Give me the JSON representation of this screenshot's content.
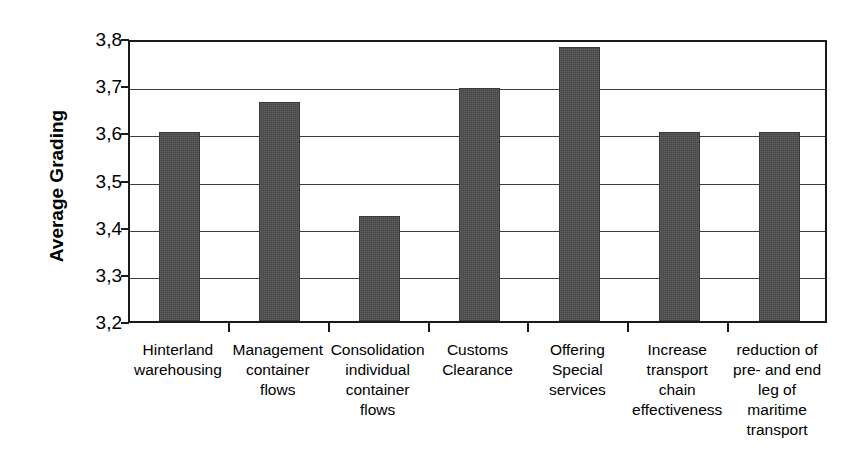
{
  "chart_data": {
    "type": "bar",
    "title": "",
    "xlabel": "",
    "ylabel": "Average Grading",
    "ylim": [
      3.2,
      3.8
    ],
    "ytick_labels": [
      "3,8",
      "3,7",
      "3,6",
      "3,5",
      "3,4",
      "3,3",
      "3,2"
    ],
    "ytick_values": [
      3.8,
      3.7,
      3.6,
      3.5,
      3.4,
      3.3,
      3.2
    ],
    "grid": true,
    "legend": "none",
    "decimal_separator": ",",
    "bar_color": "#4d4d4d",
    "categories": [
      "Hinterland\nwarehousing",
      "Management\ncontainer\nflows",
      "Consolidation\nindividual\ncontainer\nflows",
      "Customs\nClearance",
      "Offering\nSpecial\nservices",
      "Increase\ntransport\nchain\neffectiveness",
      "reduction of\npre- and end\nleg of\nmaritime\ntransport"
    ],
    "values": [
      3.6,
      3.665,
      3.423,
      3.693,
      3.78,
      3.6,
      3.6
    ]
  }
}
